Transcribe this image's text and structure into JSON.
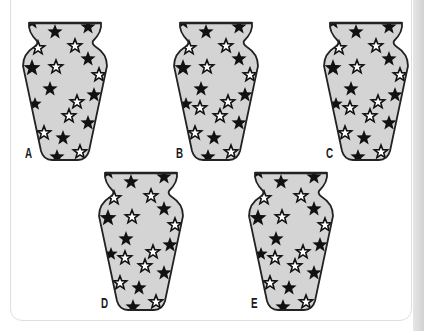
{
  "puzzle": {
    "type": "odd-one-out",
    "colors": {
      "vase_fill": "#d4d4d4",
      "vase_outline": "#222222",
      "star_filled": "#111111",
      "star_outline": "#111111",
      "panel_border": "#dedede",
      "right_strip": "#d8d8d8"
    },
    "base_stars": {
      "filled": [
        [
          10,
          0,
          8
        ],
        [
          33,
          10,
          8
        ],
        [
          66,
          5,
          8
        ],
        [
          10,
          46,
          9
        ],
        [
          66,
          37,
          8
        ],
        [
          28,
          67,
          8
        ],
        [
          72,
          73,
          8
        ],
        [
          66,
          101,
          8
        ],
        [
          41,
          116,
          8
        ],
        [
          13,
          82,
          7
        ],
        [
          35,
          135,
          8
        ]
      ],
      "outline": [
        [
          16,
          26,
          7
        ],
        [
          53,
          24,
          7
        ],
        [
          34,
          45,
          7
        ],
        [
          77,
          53,
          7
        ],
        [
          55,
          80,
          7
        ],
        [
          47,
          94,
          7
        ],
        [
          22,
          111,
          7
        ],
        [
          58,
          130,
          7
        ]
      ]
    },
    "extra_outline_star": [
      27,
      86,
      7
    ],
    "options": [
      {
        "label": "A",
        "x": 22,
        "y": 22,
        "has_extra": false
      },
      {
        "label": "B",
        "x": 173,
        "y": 22,
        "has_extra": true
      },
      {
        "label": "C",
        "x": 323,
        "y": 22,
        "has_extra": true
      },
      {
        "label": "D",
        "x": 98,
        "y": 172,
        "has_extra": true
      },
      {
        "label": "E",
        "x": 248,
        "y": 172,
        "has_extra": true
      }
    ]
  }
}
